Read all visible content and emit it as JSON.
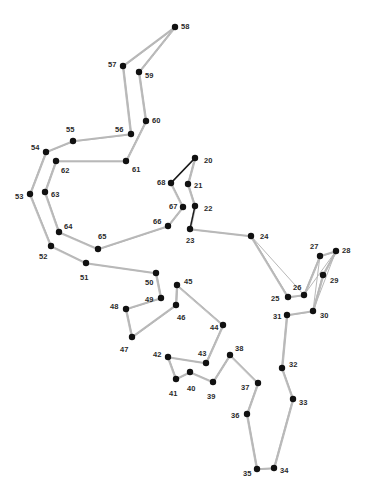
{
  "puzzle": {
    "type": "connect-the-dots",
    "colors": {
      "background": "#ffffff",
      "dot": "#111111",
      "label": "#2a2a2a",
      "trace_light": "#b8b8b8",
      "trace_dark": "#1a1a1a"
    },
    "dots": [
      {
        "n": "20",
        "x": 195,
        "y": 158,
        "lx": 204,
        "ly": 161
      },
      {
        "n": "21",
        "x": 188,
        "y": 184,
        "lx": 194,
        "ly": 186
      },
      {
        "n": "22",
        "x": 195,
        "y": 206,
        "lx": 204,
        "ly": 209
      },
      {
        "n": "23",
        "x": 190,
        "y": 229,
        "lx": 186,
        "ly": 241
      },
      {
        "n": "24",
        "x": 251,
        "y": 236,
        "lx": 260,
        "ly": 237
      },
      {
        "n": "25",
        "x": 288,
        "y": 297,
        "lx": 271,
        "ly": 299
      },
      {
        "n": "26",
        "x": 304,
        "y": 295,
        "lx": 293,
        "ly": 288
      },
      {
        "n": "27",
        "x": 320,
        "y": 256,
        "lx": 310,
        "ly": 247
      },
      {
        "n": "28",
        "x": 336,
        "y": 251,
        "lx": 342,
        "ly": 251
      },
      {
        "n": "29",
        "x": 323,
        "y": 275,
        "lx": 330,
        "ly": 281
      },
      {
        "n": "30",
        "x": 313,
        "y": 311,
        "lx": 320,
        "ly": 316
      },
      {
        "n": "31",
        "x": 287,
        "y": 315,
        "lx": 273,
        "ly": 317
      },
      {
        "n": "32",
        "x": 282,
        "y": 368,
        "lx": 289,
        "ly": 365
      },
      {
        "n": "33",
        "x": 293,
        "y": 399,
        "lx": 299,
        "ly": 403
      },
      {
        "n": "34",
        "x": 274,
        "y": 468,
        "lx": 280,
        "ly": 471
      },
      {
        "n": "35",
        "x": 257,
        "y": 469,
        "lx": 243,
        "ly": 474
      },
      {
        "n": "36",
        "x": 247,
        "y": 414,
        "lx": 231,
        "ly": 416
      },
      {
        "n": "37",
        "x": 258,
        "y": 383,
        "lx": 241,
        "ly": 388
      },
      {
        "n": "38",
        "x": 230,
        "y": 355,
        "lx": 235,
        "ly": 349
      },
      {
        "n": "39",
        "x": 213,
        "y": 382,
        "lx": 207,
        "ly": 397
      },
      {
        "n": "40",
        "x": 190,
        "y": 372,
        "lx": 187,
        "ly": 389
      },
      {
        "n": "41",
        "x": 176,
        "y": 379,
        "lx": 169,
        "ly": 394
      },
      {
        "n": "42",
        "x": 168,
        "y": 357,
        "lx": 153,
        "ly": 355
      },
      {
        "n": "43",
        "x": 206,
        "y": 363,
        "lx": 198,
        "ly": 354
      },
      {
        "n": "44",
        "x": 223,
        "y": 325,
        "lx": 210,
        "ly": 328
      },
      {
        "n": "45",
        "x": 177,
        "y": 285,
        "lx": 184,
        "ly": 282
      },
      {
        "n": "46",
        "x": 176,
        "y": 305,
        "lx": 177,
        "ly": 318
      },
      {
        "n": "47",
        "x": 132,
        "y": 337,
        "lx": 120,
        "ly": 350
      },
      {
        "n": "48",
        "x": 126,
        "y": 309,
        "lx": 110,
        "ly": 307
      },
      {
        "n": "49",
        "x": 161,
        "y": 298,
        "lx": 145,
        "ly": 300
      },
      {
        "n": "50",
        "x": 156,
        "y": 273,
        "lx": 145,
        "ly": 283
      },
      {
        "n": "51",
        "x": 86,
        "y": 263,
        "lx": 80,
        "ly": 278
      },
      {
        "n": "52",
        "x": 51,
        "y": 246,
        "lx": 39,
        "ly": 257
      },
      {
        "n": "53",
        "x": 30,
        "y": 194,
        "lx": 15,
        "ly": 197
      },
      {
        "n": "54",
        "x": 46,
        "y": 152,
        "lx": 31,
        "ly": 148
      },
      {
        "n": "55",
        "x": 73,
        "y": 141,
        "lx": 66,
        "ly": 130
      },
      {
        "n": "56",
        "x": 131,
        "y": 134,
        "lx": 115,
        "ly": 130
      },
      {
        "n": "57",
        "x": 123,
        "y": 66,
        "lx": 108,
        "ly": 65
      },
      {
        "n": "58",
        "x": 175,
        "y": 27,
        "lx": 181,
        "ly": 27
      },
      {
        "n": "59",
        "x": 139,
        "y": 72,
        "lx": 145,
        "ly": 76
      },
      {
        "n": "60",
        "x": 146,
        "y": 121,
        "lx": 152,
        "ly": 121
      },
      {
        "n": "61",
        "x": 126,
        "y": 161,
        "lx": 132,
        "ly": 170
      },
      {
        "n": "62",
        "x": 56,
        "y": 161,
        "lx": 61,
        "ly": 171
      },
      {
        "n": "63",
        "x": 45,
        "y": 192,
        "lx": 51,
        "ly": 195
      },
      {
        "n": "64",
        "x": 59,
        "y": 232,
        "lx": 64,
        "ly": 227
      },
      {
        "n": "65",
        "x": 98,
        "y": 249,
        "lx": 98,
        "ly": 237
      },
      {
        "n": "66",
        "x": 168,
        "y": 226,
        "lx": 153,
        "ly": 222
      },
      {
        "n": "67",
        "x": 183,
        "y": 207,
        "lx": 169,
        "ly": 207
      },
      {
        "n": "68",
        "x": 171,
        "y": 183,
        "lx": 157,
        "ly": 183
      }
    ]
  }
}
